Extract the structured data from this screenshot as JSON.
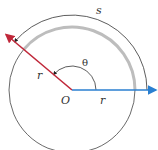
{
  "diagram": {
    "labels": {
      "arc": "s",
      "angle": "θ",
      "radius_red": "r",
      "radius_blue": "r",
      "origin": "O"
    },
    "colors": {
      "red_ray": "#c0283a",
      "blue_ray": "#2a7fd0",
      "circle": "#333333",
      "gray_arc": "#b8b8b8"
    },
    "angle_degrees": 140
  }
}
